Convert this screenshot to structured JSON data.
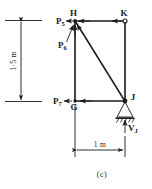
{
  "figure": {
    "caption": "(c)",
    "type": "structural-free-body-diagram",
    "nodes": [
      {
        "id": "H",
        "label": "H",
        "x": 1.0,
        "y": 1.5,
        "marker": "dot"
      },
      {
        "id": "K",
        "label": "K",
        "x": 2.0,
        "y": 1.5,
        "marker": "ring"
      },
      {
        "id": "G",
        "label": "G",
        "x": 1.0,
        "y": 0.0,
        "marker": "dot"
      },
      {
        "id": "J",
        "label": "J",
        "x": 2.0,
        "y": 0.0,
        "marker": "dot"
      }
    ],
    "members": [
      {
        "from": "H",
        "to": "K",
        "style": "solid"
      },
      {
        "from": "H",
        "to": "G",
        "style": "solid"
      },
      {
        "from": "G",
        "to": "J",
        "style": "solid"
      },
      {
        "from": "K",
        "to": "J",
        "style": "solid"
      },
      {
        "from": "H",
        "to": "J",
        "style": "diagonal"
      }
    ],
    "forces": [
      {
        "name": "P5",
        "symbol": "P",
        "subscript": "5",
        "at": "H",
        "direction": "horizontal-left"
      },
      {
        "name": "P6",
        "symbol": "P",
        "subscript": "6",
        "at": "H",
        "direction": "diagonal-up-right"
      },
      {
        "name": "P7",
        "symbol": "P",
        "subscript": "7",
        "at": "G",
        "direction": "horizontal-left"
      },
      {
        "name": "VJ",
        "symbol": "V",
        "subscript": "J",
        "at": "J",
        "direction": "vertical-up"
      }
    ],
    "support": {
      "at": "J",
      "kind": "pinned-hatched",
      "hatch_marks": 4
    },
    "dimensions": [
      {
        "name": "height",
        "text": "1·5 m",
        "orientation": "vertical",
        "side": "left"
      },
      {
        "name": "span",
        "text": "1 m",
        "orientation": "horizontal",
        "side": "bottom"
      }
    ],
    "colors": {
      "ink": "#1a1a1a",
      "background": "#ffffff"
    }
  }
}
